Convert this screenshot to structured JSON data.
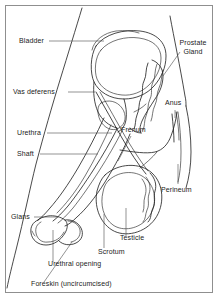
{
  "figure": {
    "type": "medical-line-drawing",
    "background_color": "#ffffff",
    "line_color": "#1a1a1a",
    "border_color": "#8f8f8f",
    "width": 218,
    "height": 298
  },
  "labels": {
    "bladder": "Bladder",
    "prostate_gland_line1": "Prostate",
    "prostate_gland_line2": "Gland",
    "vas_deferens": "Vas deferens",
    "anus": "Anus",
    "urethra": "Urethra",
    "frenum": "Frenum",
    "shaft": "Shaft",
    "perineum": "Perineum",
    "glans": "Glans",
    "testicle": "Testicle",
    "scrotum": "Scrotum",
    "urethral_opening": "Urethral opening",
    "foreskin": "Foreskin (uncircumcised)"
  },
  "parts": [
    {
      "name": "bladder",
      "label": "Bladder"
    },
    {
      "name": "prostate-gland",
      "label": "Prostate Gland"
    },
    {
      "name": "vas-deferens",
      "label": "Vas deferens"
    },
    {
      "name": "anus",
      "label": "Anus"
    },
    {
      "name": "urethra",
      "label": "Urethra"
    },
    {
      "name": "frenum",
      "label": "Frenum"
    },
    {
      "name": "shaft",
      "label": "Shaft"
    },
    {
      "name": "perineum",
      "label": "Perineum"
    },
    {
      "name": "glans",
      "label": "Glans"
    },
    {
      "name": "testicle",
      "label": "Testicle"
    },
    {
      "name": "scrotum",
      "label": "Scrotum"
    },
    {
      "name": "urethral-opening",
      "label": "Urethral opening"
    },
    {
      "name": "foreskin",
      "label": "Foreskin (uncircumcised)"
    }
  ]
}
